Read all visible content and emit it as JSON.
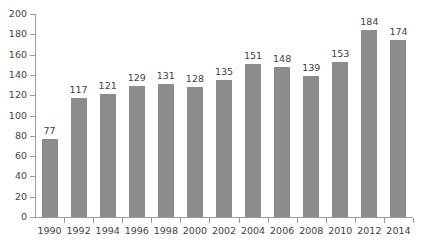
{
  "chart_data": {
    "type": "bar",
    "title": "",
    "subtitle": "",
    "xlabel": "",
    "ylabel": "",
    "categories": [
      "1990",
      "1992",
      "1994",
      "1996",
      "1998",
      "2000",
      "2002",
      "2004",
      "2006",
      "2008",
      "2010",
      "2012",
      "2014"
    ],
    "values": [
      77,
      117,
      121,
      129,
      131,
      128,
      135,
      151,
      148,
      139,
      153,
      184,
      174
    ],
    "series": [
      {
        "name": "",
        "values": [
          77,
          117,
          121,
          129,
          131,
          128,
          135,
          151,
          148,
          139,
          153,
          184,
          174
        ]
      }
    ],
    "data_labels": [
      "77",
      "117",
      "121",
      "129",
      "131",
      "128",
      "135",
      "151",
      "148",
      "139",
      "153",
      "184",
      "174"
    ],
    "ylim": [
      0,
      200
    ],
    "ytick_values": [
      0,
      20,
      40,
      60,
      80,
      100,
      120,
      140,
      160,
      180,
      200
    ],
    "ytick_labels": [
      "0",
      "20",
      "40",
      "60",
      "80",
      "100",
      "120",
      "140",
      "160",
      "180",
      "200"
    ],
    "grid": false,
    "legend": false,
    "legend_position": "none",
    "bar_color": "#8c8c8c",
    "axis_color": "#9a9a9a",
    "background_color": "#ffffff",
    "text_color": "#3f3f3f"
  }
}
